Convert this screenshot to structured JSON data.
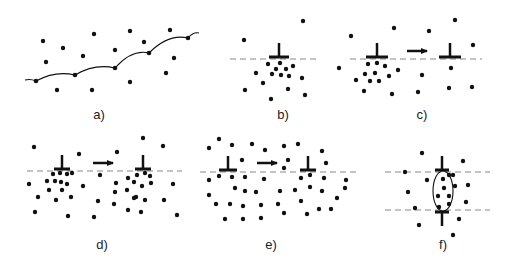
{
  "figure": {
    "width": 514,
    "height": 269,
    "ink_color": "#111111",
    "dash_color": "#888888",
    "panels": [
      {
        "id": "a",
        "label": "a)",
        "label_pos": [
          99,
          119
        ],
        "curve": [
          [
            25,
            80
          ],
          [
            36,
            81
          ],
          [
            75,
            75
          ],
          [
            115,
            68
          ],
          [
            149,
            53
          ],
          [
            188,
            38
          ],
          [
            199,
            33
          ]
        ],
        "nodes": [
          [
            36,
            81
          ],
          [
            75,
            75
          ],
          [
            115,
            68
          ],
          [
            149,
            53
          ],
          [
            188,
            38
          ]
        ],
        "dots": [
          [
            43,
            41
          ],
          [
            63,
            48
          ],
          [
            46,
            62
          ],
          [
            94,
            34
          ],
          [
            83,
            56
          ],
          [
            130,
            31
          ],
          [
            115,
            50
          ],
          [
            144,
            42
          ],
          [
            170,
            30
          ],
          [
            174,
            58
          ],
          [
            166,
            73
          ],
          [
            57,
            90
          ],
          [
            92,
            90
          ],
          [
            130,
            82
          ]
        ]
      },
      {
        "id": "b",
        "label": "b)",
        "label_pos": [
          283,
          119
        ],
        "dashes": [
          [
            230,
            319,
            59
          ]
        ],
        "tees": [
          {
            "x": 279,
            "y": 57,
            "w": 20,
            "dir": "up"
          }
        ],
        "dots": [
          [
            244,
            40
          ],
          [
            303,
            21
          ],
          [
            268,
            64
          ],
          [
            280,
            63
          ],
          [
            276,
            69
          ],
          [
            286,
            69
          ],
          [
            293,
            66
          ],
          [
            256,
            73
          ],
          [
            272,
            74
          ],
          [
            281,
            75
          ],
          [
            289,
            76
          ],
          [
            302,
            78
          ],
          [
            263,
            83
          ],
          [
            245,
            90
          ],
          [
            288,
            89
          ],
          [
            305,
            95
          ],
          [
            271,
            99
          ]
        ]
      },
      {
        "id": "c",
        "label": "c)",
        "label_pos": [
          422,
          119
        ],
        "dashes": [
          [
            350,
            482,
            59
          ]
        ],
        "tees": [
          {
            "x": 377,
            "y": 57,
            "w": 22,
            "dir": "up"
          },
          {
            "x": 450,
            "y": 57,
            "w": 22,
            "dir": "up"
          }
        ],
        "arrows": [
          [
            407,
            427,
            51
          ]
        ],
        "dots": [
          [
            351,
            36
          ],
          [
            394,
            28
          ],
          [
            429,
            31
          ],
          [
            455,
            20
          ],
          [
            473,
            45
          ],
          [
            339,
            68
          ],
          [
            368,
            64
          ],
          [
            377,
            63
          ],
          [
            385,
            66
          ],
          [
            398,
            70
          ],
          [
            365,
            74
          ],
          [
            375,
            73
          ],
          [
            389,
            76
          ],
          [
            356,
            80
          ],
          [
            370,
            81
          ],
          [
            379,
            81
          ],
          [
            364,
            91
          ],
          [
            392,
            94
          ],
          [
            422,
            75
          ],
          [
            418,
            92
          ],
          [
            451,
            68
          ],
          [
            449,
            88
          ],
          [
            472,
            87
          ]
        ]
      },
      {
        "id": "d",
        "label": "d)",
        "label_pos": [
          102,
          249
        ],
        "dashes": [
          [
            27,
            182,
            171
          ]
        ],
        "tees": [
          {
            "x": 62,
            "y": 169,
            "w": 16,
            "dir": "up"
          },
          {
            "x": 143,
            "y": 169,
            "w": 16,
            "dir": "up"
          }
        ],
        "arrows": [
          [
            93,
            113,
            163
          ]
        ],
        "dots": [
          [
            34,
            147
          ],
          [
            79,
            154
          ],
          [
            117,
            152
          ],
          [
            143,
            138
          ],
          [
            163,
            146
          ],
          [
            53,
            174
          ],
          [
            60,
            173
          ],
          [
            67,
            174
          ],
          [
            72,
            173
          ],
          [
            47,
            181
          ],
          [
            55,
            181
          ],
          [
            61,
            182
          ],
          [
            67,
            184
          ],
          [
            29,
            184
          ],
          [
            49,
            190
          ],
          [
            62,
            190
          ],
          [
            83,
            186
          ],
          [
            38,
            197
          ],
          [
            56,
            200
          ],
          [
            71,
            197
          ],
          [
            35,
            212
          ],
          [
            68,
            216
          ],
          [
            94,
            217
          ],
          [
            100,
            175
          ],
          [
            128,
            178
          ],
          [
            137,
            175
          ],
          [
            145,
            173
          ],
          [
            150,
            176
          ],
          [
            116,
            183
          ],
          [
            134,
            182
          ],
          [
            142,
            186
          ],
          [
            151,
            183
          ],
          [
            173,
            184
          ],
          [
            115,
            192
          ],
          [
            127,
            190
          ],
          [
            136,
            197
          ],
          [
            98,
            201
          ],
          [
            114,
            204
          ],
          [
            134,
            198
          ],
          [
            145,
            200
          ],
          [
            164,
            200
          ],
          [
            128,
            210
          ],
          [
            141,
            212
          ],
          [
            177,
            215
          ]
        ]
      },
      {
        "id": "e",
        "label": "e)",
        "label_pos": [
          271,
          249
        ],
        "dashes": [
          [
            200,
            358,
            172
          ]
        ],
        "tees": [
          {
            "x": 228,
            "y": 170,
            "w": 18,
            "dir": "up"
          },
          {
            "x": 308,
            "y": 170,
            "w": 16,
            "dir": "up"
          }
        ],
        "arrows": [
          [
            257,
            277,
            163
          ]
        ],
        "dots": [
          [
            209,
            148
          ],
          [
            219,
            139
          ],
          [
            232,
            145
          ],
          [
            252,
            144
          ],
          [
            265,
            150
          ],
          [
            284,
            146
          ],
          [
            298,
            144
          ],
          [
            322,
            151
          ],
          [
            242,
            160
          ],
          [
            288,
            160
          ],
          [
            326,
            163
          ],
          [
            284,
            168
          ],
          [
            209,
            180
          ],
          [
            219,
            176
          ],
          [
            232,
            177
          ],
          [
            245,
            177
          ],
          [
            264,
            179
          ],
          [
            301,
            178
          ],
          [
            310,
            175
          ],
          [
            324,
            178
          ],
          [
            346,
            180
          ],
          [
            235,
            188
          ],
          [
            245,
            191
          ],
          [
            256,
            192
          ],
          [
            280,
            191
          ],
          [
            295,
            190
          ],
          [
            310,
            187
          ],
          [
            322,
            191
          ],
          [
            345,
            188
          ],
          [
            209,
            195
          ],
          [
            337,
            198
          ],
          [
            216,
            204
          ],
          [
            230,
            204
          ],
          [
            243,
            206
          ],
          [
            261,
            205
          ],
          [
            278,
            204
          ],
          [
            301,
            201
          ],
          [
            319,
            209
          ],
          [
            331,
            209
          ],
          [
            225,
            219
          ],
          [
            243,
            219
          ],
          [
            261,
            218
          ],
          [
            284,
            213
          ],
          [
            307,
            214
          ]
        ]
      },
      {
        "id": "f",
        "label": "f)",
        "label_pos": [
          443,
          249
        ],
        "dashes": [
          [
            385,
            490,
            172
          ],
          [
            385,
            490,
            210
          ]
        ],
        "tees": [
          {
            "x": 442,
            "y": 170,
            "w": 14,
            "dir": "up"
          },
          {
            "x": 442,
            "y": 212,
            "w": 14,
            "dir": "down"
          }
        ],
        "loop": {
          "cx": 443,
          "cy": 191,
          "rx": 10,
          "ry": 20
        },
        "dots": [
          [
            422,
            153
          ],
          [
            463,
            161
          ],
          [
            405,
            172
          ],
          [
            427,
            180
          ],
          [
            443,
            179
          ],
          [
            449,
            175
          ],
          [
            453,
            175
          ],
          [
            444,
            188
          ],
          [
            455,
            186
          ],
          [
            408,
            192
          ],
          [
            468,
            185
          ],
          [
            438,
            196
          ],
          [
            449,
            196
          ],
          [
            415,
            208
          ],
          [
            439,
            207
          ],
          [
            449,
            204
          ],
          [
            466,
            202
          ],
          [
            459,
            219
          ],
          [
            419,
            225
          ],
          [
            453,
            235
          ]
        ]
      }
    ]
  }
}
